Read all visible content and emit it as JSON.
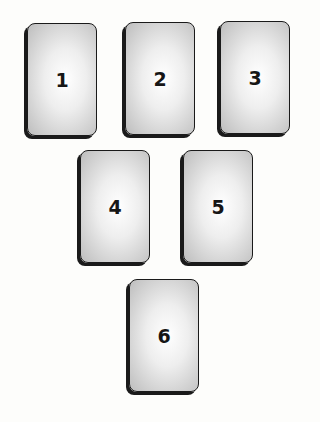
{
  "spread": {
    "cards": [
      {
        "label": "1",
        "x": 27,
        "y": 23
      },
      {
        "label": "2",
        "x": 125,
        "y": 22
      },
      {
        "label": "3",
        "x": 220,
        "y": 21
      },
      {
        "label": "4",
        "x": 80,
        "y": 150
      },
      {
        "label": "5",
        "x": 183,
        "y": 150
      },
      {
        "label": "6",
        "x": 129,
        "y": 279
      }
    ]
  }
}
